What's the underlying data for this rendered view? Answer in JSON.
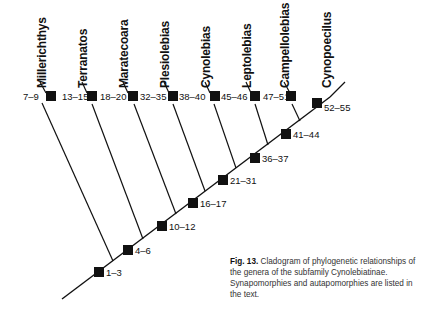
{
  "figure": {
    "type": "cladogram",
    "taxa": [
      {
        "name": "Millerichthys",
        "characters": "7–9"
      },
      {
        "name": "Terranatos",
        "characters": "13–15"
      },
      {
        "name": "Maratecoara",
        "characters": "18–20"
      },
      {
        "name": "Plesiolebias",
        "characters": "32–35"
      },
      {
        "name": "Cynolebias",
        "characters": "38–40"
      },
      {
        "name": "Leptolebias",
        "characters": "45–46"
      },
      {
        "name": "Campellolebias",
        "characters": "47–51"
      },
      {
        "name": "Cynopoecilus",
        "characters": "52–55"
      }
    ],
    "internal_nodes": [
      {
        "characters": "1–3"
      },
      {
        "characters": "4–6"
      },
      {
        "characters": "10–12"
      },
      {
        "characters": "16–17"
      },
      {
        "characters": "21–31"
      },
      {
        "characters": "36–37"
      },
      {
        "characters": "41–44"
      }
    ],
    "colors": {
      "line": "#111111",
      "node": "#111111",
      "caption": "#333333"
    }
  },
  "caption": {
    "label": "Fig. 13.",
    "text": "Cladogram of phylogenetic relationships of the genera of the subfamily Cynolebiatinae. Synapomorphies and autapomorphies are listed in the text."
  }
}
